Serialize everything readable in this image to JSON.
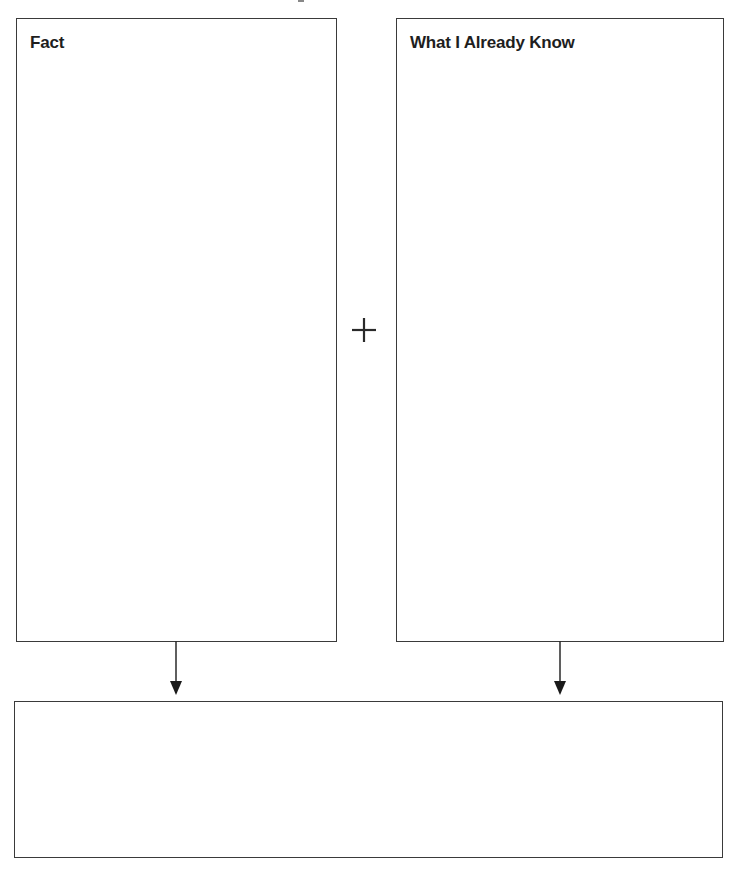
{
  "organizer": {
    "fact_box": {
      "title": "Fact",
      "content": ""
    },
    "know_box": {
      "title": "What I Already Know",
      "content": ""
    },
    "operator": {
      "symbol": "+",
      "icon": "plus-icon"
    },
    "result_box": {
      "content": ""
    },
    "arrows": [
      {
        "icon": "arrow-down-icon",
        "from": "fact_box",
        "to": "result_box"
      },
      {
        "icon": "arrow-down-icon",
        "from": "know_box",
        "to": "result_box"
      }
    ],
    "colors": {
      "border": "#3a3a3a",
      "text": "#1e1e1e",
      "background": "#ffffff"
    }
  }
}
